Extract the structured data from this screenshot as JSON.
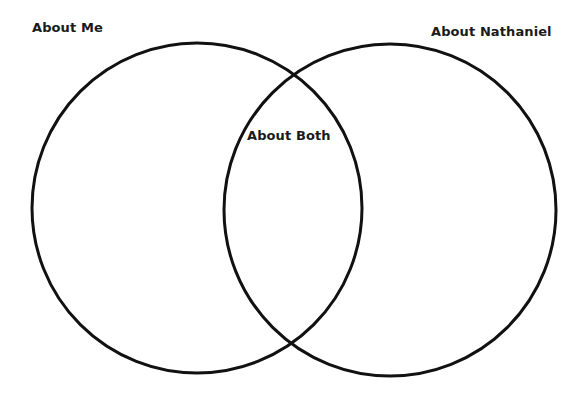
{
  "diagram": {
    "type": "venn",
    "sets": [
      {
        "id": "left",
        "label": "About Me"
      },
      {
        "id": "right",
        "label": "About Nathaniel"
      }
    ],
    "intersection": {
      "label": "About Both"
    },
    "stroke_color": "#111111",
    "background_color": "#ffffff"
  }
}
